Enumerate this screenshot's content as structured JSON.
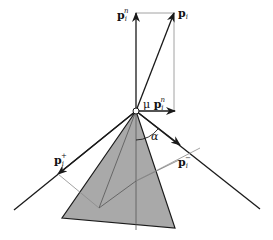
{
  "figure": {
    "colors": {
      "shaded_pyramid": "#a9a9a9",
      "stroke": "#1a1a1a",
      "thin_line": "#8a8a8a"
    },
    "labels": {
      "p_i_n": {
        "base": "p",
        "sub": "i",
        "sup": "n"
      },
      "p_i": {
        "base": "p",
        "sub": "i"
      },
      "mu_p_i_n": {
        "prefix": "μ",
        "base": "p",
        "sub": "i",
        "sup": "n"
      },
      "alpha": "α",
      "p_i_plus": {
        "base": "p",
        "sub": "i",
        "sup": "+"
      },
      "p_i_minus": {
        "base": "p",
        "sub": "i",
        "sup": "−"
      }
    }
  }
}
